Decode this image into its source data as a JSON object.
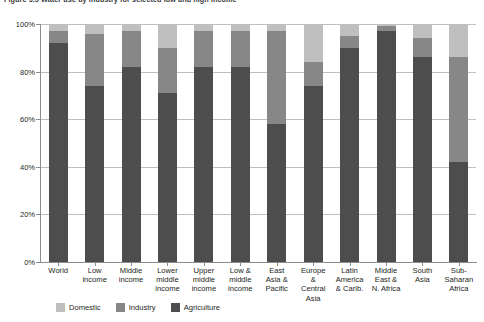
{
  "figure": {
    "title": "Figure 3.5  Water use by industry for selected low and high income"
  },
  "axes": {
    "y_ticks": [
      "100%",
      "80%",
      "60%",
      "40%",
      "20%",
      "0%"
    ]
  },
  "legend": {
    "items": [
      {
        "label": "Domestic",
        "color": "#bfbfbf",
        "key": "domestic"
      },
      {
        "label": "Industry",
        "color": "#878787",
        "key": "industry"
      },
      {
        "label": "Agriculture",
        "color": "#4d4d4d",
        "key": "agriculture"
      }
    ]
  },
  "chart_data": {
    "type": "bar",
    "stacked": true,
    "stack_total": 100,
    "title": "Figure 3.5  Water use by industry for selected low and high income",
    "xlabel": "",
    "ylabel": "",
    "ylim": [
      0,
      100
    ],
    "ytick_labels": [
      "0%",
      "20%",
      "40%",
      "60%",
      "80%",
      "100%"
    ],
    "grid": true,
    "legend_position": "bottom-left",
    "categories": [
      "World",
      "Low income",
      "Middle income",
      "Lower middle income",
      "Upper middle income",
      "Low & middle income",
      "East Asia & Pacific",
      "Europe & Central Asia",
      "Latin America & Carib.",
      "Middle East & N. Africa",
      "South Asia",
      "Sub-Saharan Africa"
    ],
    "category_label_lines": [
      [
        "World"
      ],
      [
        "Low",
        "income"
      ],
      [
        "Middle",
        "income"
      ],
      [
        "Lower",
        "middle",
        "income"
      ],
      [
        "Upper",
        "middle",
        "income"
      ],
      [
        "Low &",
        "middle",
        "income"
      ],
      [
        "East",
        "Asia &",
        "Pacific"
      ],
      [
        "Europe",
        "&",
        "Central",
        "Asia"
      ],
      [
        "Latin",
        "America",
        "& Carib."
      ],
      [
        "Middle",
        "East &",
        "N. Africa"
      ],
      [
        "South",
        "Asia"
      ],
      [
        "Sub-",
        "Saharan",
        "Africa"
      ]
    ],
    "series": [
      {
        "name": "Agriculture",
        "color": "#4d4d4d",
        "values": [
          92,
          74,
          82,
          71,
          82,
          82,
          58,
          74,
          90,
          97,
          86,
          42
        ]
      },
      {
        "name": "Industry",
        "color": "#878787",
        "values": [
          5,
          22,
          15,
          19,
          15,
          15,
          39,
          10,
          5,
          2,
          8,
          44
        ]
      },
      {
        "name": "Domestic",
        "color": "#bfbfbf",
        "values": [
          3,
          4,
          3,
          10,
          3,
          3,
          3,
          16,
          5,
          1,
          6,
          14
        ]
      }
    ]
  }
}
